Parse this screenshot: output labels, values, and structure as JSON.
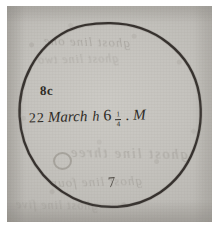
{
  "document": {
    "type": "manuscript-observation-sketch",
    "medium": "ink on aged paper"
  },
  "paper": {
    "tone_hex": "#c7c5c0",
    "ink_hex": "#2b2722",
    "mount_hex": "#ffffff"
  },
  "drawing": {
    "shape_name": "hand-drawn circle",
    "description": "single closed ink circle occupying most of the sheet"
  },
  "annotations": {
    "code": "8c",
    "observation": {
      "day": "22",
      "month": "March",
      "hour_symbol": "h",
      "hour_value": "6",
      "fraction_numerator": "1",
      "fraction_denominator": "4",
      "separator": ".",
      "suffix": "M",
      "full_text": "22 March h 6 1/4 . M"
    },
    "index_mark": "7"
  },
  "bleed_through": {
    "note": "faint mirrored writing showing through from the reverse of the leaf",
    "lines": [
      "ghost line one",
      "ghost line two",
      "ghost line three",
      "ghost line four",
      "ghost line five"
    ]
  }
}
